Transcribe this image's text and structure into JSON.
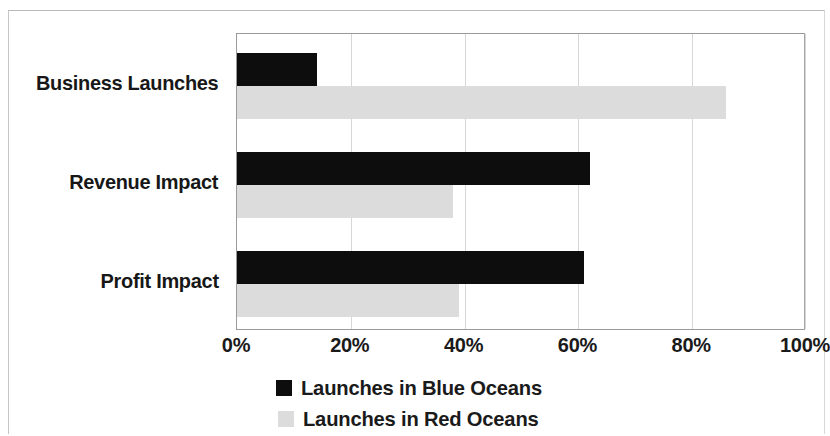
{
  "chart_data": {
    "type": "bar",
    "orientation": "horizontal",
    "title": "",
    "subtitle": "",
    "xlabel": "",
    "ylabel": "",
    "xlim": [
      0,
      100
    ],
    "xunit": "%",
    "grid": true,
    "legend_position": "bottom",
    "categories": [
      "Business Launches",
      "Revenue Impact",
      "Profit Impact"
    ],
    "xticks": [
      "0%",
      "20%",
      "40%",
      "60%",
      "80%",
      "100%"
    ],
    "xtick_values": [
      0,
      20,
      40,
      60,
      80,
      100
    ],
    "series": [
      {
        "name": "Launches in Blue Oceans",
        "color": "#0d0d0d",
        "values": [
          14,
          62,
          61
        ]
      },
      {
        "name": "Launches in Red Oceans",
        "color": "#dcdcdc",
        "values": [
          86,
          38,
          39
        ]
      }
    ]
  },
  "legend": {
    "items": [
      {
        "label": "Launches in Blue Oceans",
        "color": "#0d0d0d"
      },
      {
        "label": "Launches in Red Oceans",
        "color": "#dcdcdc"
      }
    ]
  }
}
